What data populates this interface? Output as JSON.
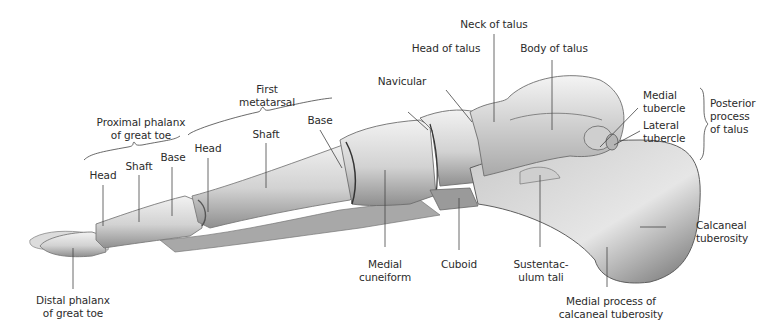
{
  "figure": {
    "background": "#ffffff",
    "bone_color": "#d9d9d9",
    "bone_shadow": "#8a8a8a",
    "leader_color": "#444444"
  },
  "labels": {
    "proximal_phalanx_group": "Proximal phalanx\nof great toe",
    "first_metatarsal_group": "First\nmetatarsal",
    "pp_head": "Head",
    "pp_shaft": "Shaft",
    "pp_base": "Base",
    "mt_head": "Head",
    "mt_shaft": "Shaft",
    "mt_base": "Base",
    "navicular": "Navicular",
    "head_of_talus": "Head of talus",
    "neck_of_talus": "Neck of talus",
    "body_of_talus": "Body of talus",
    "medial_tubercle": "Medial\ntubercle",
    "lateral_tubercle": "Lateral\ntubercle",
    "posterior_process_group": "Posterior\nprocess\nof talus",
    "calcaneal_tuberosity": "Calcaneal\ntuberosity",
    "medial_process": "Medial process of\ncalcaneal tuberosity",
    "sustentaculum_tali": "Sustentac-\nulum tali",
    "cuboid": "Cuboid",
    "medial_cuneiform": "Medial\ncuneiform",
    "distal_phalanx": "Distal phalanx\nof great toe"
  }
}
